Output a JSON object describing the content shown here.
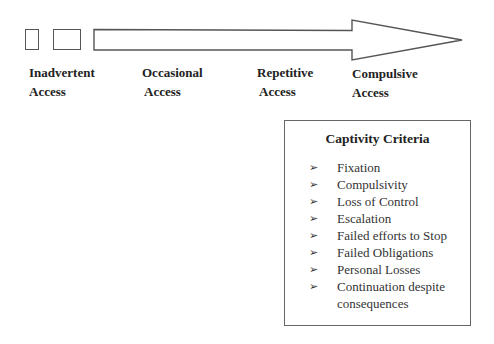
{
  "stages": [
    {
      "line1": "Inadvertent",
      "line2": "Access"
    },
    {
      "line1": "Occasional",
      "line2": "Access"
    },
    {
      "line1": "Repetitive",
      "line2": "Access"
    },
    {
      "line1": "Compulsive",
      "line2": "Access"
    }
  ],
  "criteria": {
    "title": "Captivity Criteria",
    "bullet_glyph": "➢",
    "items": [
      "Fixation",
      "Compulsivity",
      "Loss of Control",
      "Escalation",
      "Failed efforts to Stop",
      "Failed Obligations",
      "Personal Losses",
      "Continuation despite consequences"
    ]
  }
}
